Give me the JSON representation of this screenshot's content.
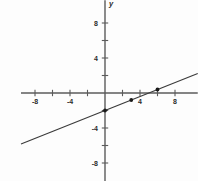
{
  "chart_data": {
    "type": "line",
    "title": "",
    "xlabel": "x",
    "ylabel": "y",
    "xlim": [
      -9.6,
      10.6
    ],
    "ylim": [
      -10.6,
      10.6
    ],
    "grid": false,
    "legend": null,
    "x_tick_labels": [
      "-8",
      "-4",
      "4",
      "8"
    ],
    "x_tick_values": [
      -8,
      -4,
      4,
      8
    ],
    "x_minor_ticks": [
      -8,
      -6,
      -4,
      -2,
      2,
      4,
      6,
      8
    ],
    "y_tick_labels": [
      "8",
      "4",
      "-4",
      "-8"
    ],
    "y_tick_values": [
      8,
      4,
      -4,
      -8
    ],
    "y_minor_ticks": [
      -8,
      -6,
      -4,
      -2,
      2,
      4,
      6,
      8
    ],
    "series": [
      {
        "name": "line",
        "type": "line",
        "equation": "y = 0.4x - 2",
        "slope": 0.4,
        "intercept": -2,
        "x": [
          -9.6,
          10.6
        ],
        "values": [
          -5.84,
          2.24
        ]
      },
      {
        "name": "plotted-points",
        "type": "scatter",
        "x": [
          0,
          3,
          6
        ],
        "values": [
          -2,
          -0.8,
          0.4
        ]
      }
    ]
  },
  "axes": {
    "x_axis_label": "x",
    "y_axis_label": "y"
  },
  "ticks": {
    "x": [
      {
        "value": -8,
        "label": "-8"
      },
      {
        "value": -4,
        "label": "-4"
      },
      {
        "value": 4,
        "label": "4"
      },
      {
        "value": 8,
        "label": "8"
      }
    ],
    "y": [
      {
        "value": 8,
        "label": "8"
      },
      {
        "value": 4,
        "label": "4"
      },
      {
        "value": -4,
        "label": "-4"
      },
      {
        "value": -8,
        "label": "-8"
      }
    ]
  },
  "colors": {
    "background": "#fdfdfd",
    "axis": "#5b5b5b",
    "line": "#3a3a3a",
    "point": "#1a1a1a",
    "text": "#2b2b2b"
  }
}
